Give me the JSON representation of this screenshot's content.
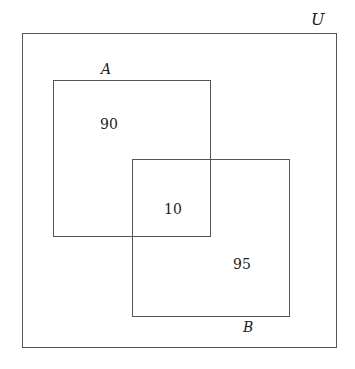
{
  "diagram": {
    "type": "venn",
    "universe": {
      "label": "U"
    },
    "sets": [
      {
        "label": "A",
        "only_count": "90"
      },
      {
        "label": "B",
        "only_count": "95"
      }
    ],
    "intersection": {
      "count": "10"
    }
  }
}
